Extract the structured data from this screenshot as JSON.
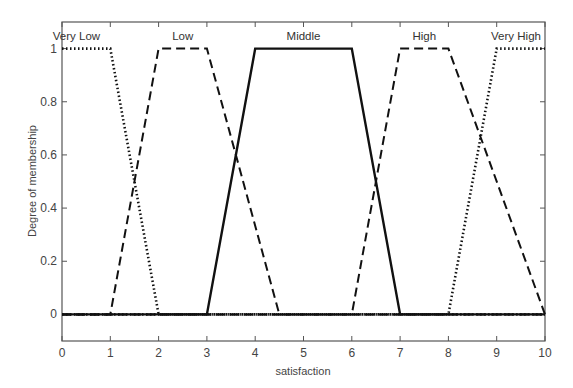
{
  "chart_data": {
    "type": "line",
    "title": "",
    "xlabel": "satisfaction",
    "ylabel": "Degree of membership",
    "xlim": [
      0,
      10
    ],
    "ylim": [
      -0.1,
      1.1
    ],
    "xticks": [
      0,
      1,
      2,
      3,
      4,
      5,
      6,
      7,
      8,
      9,
      10
    ],
    "yticks": [
      0,
      0.2,
      0.4,
      0.6,
      0.8,
      1
    ],
    "ytick_labels": [
      "0",
      "0.2",
      "0.4",
      "0.6",
      "0.8",
      "1"
    ],
    "grid": false,
    "legend": "none (labels placed above each curve)",
    "series": [
      {
        "name": "Very Low",
        "style": "dotted",
        "x": [
          0,
          1,
          2,
          10
        ],
        "y": [
          1,
          1,
          0,
          0
        ],
        "label_x": 0.3
      },
      {
        "name": "Low",
        "style": "dashed",
        "x": [
          0,
          1,
          2,
          3,
          4.5,
          10
        ],
        "y": [
          0,
          0,
          1,
          1,
          0,
          0
        ],
        "label_x": 2.5
      },
      {
        "name": "Middle",
        "style": "solid",
        "x": [
          0,
          3,
          4,
          6,
          7,
          10
        ],
        "y": [
          0,
          0,
          1,
          1,
          0,
          0
        ],
        "label_x": 5.0
      },
      {
        "name": "High",
        "style": "dashed",
        "x": [
          0,
          6,
          7,
          8,
          10
        ],
        "y": [
          0,
          0,
          1,
          1,
          0
        ],
        "label_x": 7.5
      },
      {
        "name": "Very High",
        "style": "dotted",
        "x": [
          0,
          8,
          9,
          10
        ],
        "y": [
          0,
          0,
          1,
          1
        ],
        "label_x": 9.4
      }
    ]
  }
}
